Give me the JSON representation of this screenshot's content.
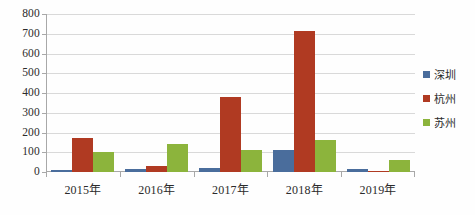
{
  "chart_data": {
    "type": "bar",
    "title": "",
    "subtitle": "",
    "xlabel": "",
    "ylabel": "",
    "categories": [
      "2015年",
      "2016年",
      "2017年",
      "2018年",
      "2019年"
    ],
    "series": [
      {
        "name": "深圳",
        "color": "#4a6d9c",
        "values": [
          12,
          16,
          22,
          110,
          13
        ]
      },
      {
        "name": "杭州",
        "color": "#b03a22",
        "values": [
          170,
          30,
          380,
          715,
          5
        ]
      },
      {
        "name": "苏州",
        "color": "#8cb43c",
        "values": [
          100,
          140,
          110,
          160,
          60
        ]
      }
    ],
    "ylim": [
      0,
      800
    ],
    "y_ticks": [
      0,
      100,
      200,
      300,
      400,
      500,
      600,
      700,
      800
    ],
    "y_tick_labels": [
      "0",
      "100",
      "200",
      "300",
      "400",
      "500",
      "600",
      "700",
      "800"
    ],
    "grid": true,
    "legend_position": "right",
    "legend_entries": [
      "深圳",
      "杭州",
      "苏州"
    ]
  },
  "axis": {
    "line_color": "#a8a8a8",
    "grid_color": "#d9d9d9"
  }
}
